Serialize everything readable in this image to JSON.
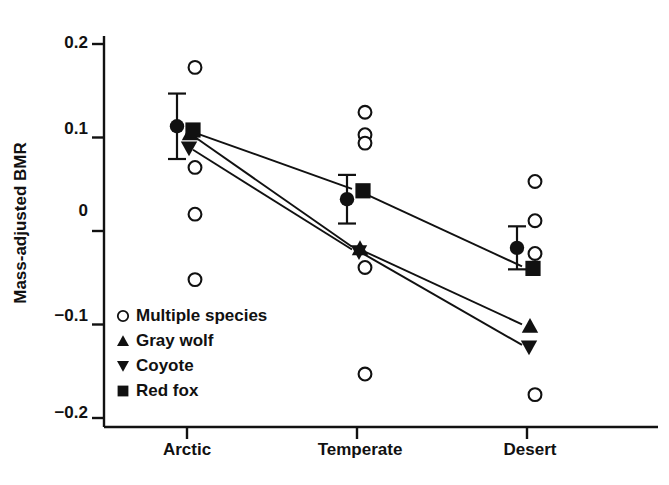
{
  "chart_data": {
    "type": "scatter",
    "title": "",
    "xlabel": "",
    "ylabel": "Mass-adjusted BMR",
    "categories": [
      "Arctic",
      "Temperate",
      "Desert"
    ],
    "ylim": [
      -0.2,
      0.2
    ],
    "yticks": [
      0.2,
      0.1,
      0,
      -0.1,
      -0.2
    ],
    "ytick_labels": [
      "0.2",
      "0.1",
      "0",
      "−0.1",
      "−0.2"
    ],
    "grid": false,
    "legend_position": "lower-left-inside",
    "legend": [
      {
        "label": "Multiple species",
        "marker": "open-circle"
      },
      {
        "label": "Gray wolf",
        "marker": "filled-up-triangle"
      },
      {
        "label": "Coyote",
        "marker": "filled-down-triangle"
      },
      {
        "label": "Red fox",
        "marker": "filled-square"
      }
    ],
    "series": [
      {
        "name": "Multiple species",
        "marker": "open-circle",
        "points": [
          {
            "x": "Arctic",
            "y": 0.175
          },
          {
            "x": "Arctic",
            "y": 0.068
          },
          {
            "x": "Arctic",
            "y": 0.018
          },
          {
            "x": "Arctic",
            "y": -0.052
          },
          {
            "x": "Temperate",
            "y": 0.127
          },
          {
            "x": "Temperate",
            "y": 0.103
          },
          {
            "x": "Temperate",
            "y": 0.094
          },
          {
            "x": "Temperate",
            "y": -0.039
          },
          {
            "x": "Temperate",
            "y": -0.153
          },
          {
            "x": "Desert",
            "y": 0.053
          },
          {
            "x": "Desert",
            "y": 0.011
          },
          {
            "x": "Desert",
            "y": -0.024
          },
          {
            "x": "Desert",
            "y": -0.175
          }
        ]
      },
      {
        "name": "Mean ± SE",
        "marker": "filled-circle",
        "points": [
          {
            "x": "Arctic",
            "y": 0.112,
            "err_low": 0.077,
            "err_high": 0.147
          },
          {
            "x": "Temperate",
            "y": 0.034,
            "err_low": 0.008,
            "err_high": 0.06
          },
          {
            "x": "Desert",
            "y": -0.018,
            "err_low": -0.041,
            "err_high": 0.005
          }
        ]
      },
      {
        "name": "Gray wolf",
        "marker": "filled-up-triangle",
        "connected": true,
        "points": [
          {
            "x": "Arctic",
            "y": 0.104
          },
          {
            "x": "Temperate",
            "y": -0.019
          },
          {
            "x": "Desert",
            "y": -0.102
          }
        ]
      },
      {
        "name": "Coyote",
        "marker": "filled-down-triangle",
        "connected": true,
        "points": [
          {
            "x": "Arctic",
            "y": 0.089
          },
          {
            "x": "Temperate",
            "y": -0.022
          },
          {
            "x": "Desert",
            "y": -0.124
          }
        ]
      },
      {
        "name": "Red fox",
        "marker": "filled-square",
        "connected": true,
        "points": [
          {
            "x": "Arctic",
            "y": 0.108
          },
          {
            "x": "Temperate",
            "y": 0.043
          },
          {
            "x": "Desert",
            "y": -0.04
          }
        ]
      }
    ]
  },
  "axis": {
    "y_title": "Mass-adjusted BMR",
    "y_tick_labels": [
      "0.2",
      "0.1",
      "0",
      "−0.1",
      "−0.2"
    ],
    "x_tick_labels": [
      "Arctic",
      "Temperate",
      "Desert"
    ]
  },
  "legend": {
    "items": [
      {
        "label": "Multiple species",
        "icon": "open-circle-icon"
      },
      {
        "label": "Gray wolf",
        "icon": "up-triangle-icon"
      },
      {
        "label": "Coyote",
        "icon": "down-triangle-icon"
      },
      {
        "label": "Red fox",
        "icon": "filled-square-icon"
      }
    ]
  },
  "colors": {
    "ink": "#111111",
    "background": "#ffffff"
  }
}
